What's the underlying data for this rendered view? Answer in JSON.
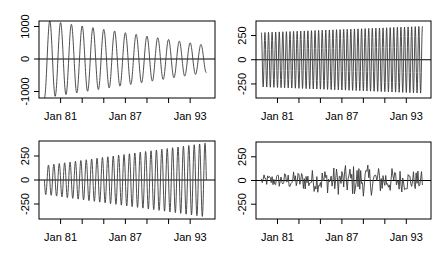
{
  "chart_data": [
    {
      "panel": "top-left",
      "type": "line",
      "title": "",
      "xlabel": "",
      "ylabel": "",
      "x_tick_labels": [
        "Jan 81",
        "Jan 87",
        "Jan 93"
      ],
      "y_tick_labels": [
        "-1000",
        "0",
        "1000"
      ],
      "y_ticks": [
        -1000,
        0,
        1000
      ],
      "ylim": [
        -1200,
        1170
      ],
      "xlim": [
        1979.0,
        1995.3
      ],
      "horizontal_reference_line": 0,
      "series": [
        {
          "name": "component",
          "start": 1979.5,
          "end": 1994.5,
          "cycles_per_year": 1.0,
          "amp_start": 1200,
          "amp_end": 420,
          "phase": 3.14159,
          "noise": 0
        }
      ],
      "box": {
        "left": 39,
        "top": 21,
        "right": 215,
        "bottom": 98
      }
    },
    {
      "panel": "top-right",
      "type": "line",
      "title": "",
      "xlabel": "",
      "ylabel": "",
      "x_tick_labels": [
        "Jan 81",
        "Jan 87",
        "Jan 93"
      ],
      "y_tick_labels": [
        "-250",
        "0",
        "250"
      ],
      "y_ticks": [
        -250,
        0,
        250
      ],
      "ylim": [
        -395,
        400
      ],
      "xlim": [
        1979.0,
        1995.3
      ],
      "horizontal_reference_line": 0,
      "series": [
        {
          "name": "component",
          "start": 1979.5,
          "end": 1994.5,
          "cycles_per_year": 3.0,
          "amp_start": 280,
          "amp_end": 345,
          "phase": 0,
          "noise": 0
        }
      ],
      "box": {
        "left": 256,
        "top": 21,
        "right": 431,
        "bottom": 98
      }
    },
    {
      "panel": "bottom-left",
      "type": "line",
      "title": "",
      "xlabel": "",
      "ylabel": "",
      "x_tick_labels": [
        "Jan 81",
        "Jan 87",
        "Jan 93"
      ],
      "y_tick_labels": [
        "-250",
        "0",
        "250"
      ],
      "y_ticks": [
        -250,
        0,
        250
      ],
      "ylim": [
        -406,
        406
      ],
      "xlim": [
        1979.0,
        1995.3
      ],
      "horizontal_reference_line": 0,
      "series": [
        {
          "name": "component",
          "start": 1979.5,
          "end": 1994.5,
          "cycles_per_year": 2.0,
          "amp_start": 150,
          "amp_end": 385,
          "phase": 1.57,
          "noise": 0
        }
      ],
      "box": {
        "left": 39,
        "top": 141,
        "right": 215,
        "bottom": 219
      }
    },
    {
      "panel": "bottom-right",
      "type": "line",
      "title": "",
      "xlabel": "",
      "ylabel": "",
      "x_tick_labels": [
        "Jan 81",
        "Jan 87",
        "Jan 93"
      ],
      "y_tick_labels": [
        "-250",
        "0",
        "250"
      ],
      "y_ticks": [
        -250,
        0,
        250
      ],
      "ylim": [
        -406,
        406
      ],
      "xlim": [
        1979.0,
        1995.3
      ],
      "horizontal_reference_line": 0,
      "series": [
        {
          "name": "residual",
          "start": 1979.5,
          "end": 1994.5,
          "cycles_per_year": 6.0,
          "amp_start": 80,
          "amp_mid": 250,
          "amp_end": 140,
          "phase": 0,
          "noise": 1
        }
      ],
      "box": {
        "left": 256,
        "top": 142,
        "right": 431,
        "bottom": 219
      }
    }
  ],
  "x_axis": {
    "major_ticks": [
      1981,
      1987,
      1993
    ],
    "minor_ticks": [
      1983,
      1985,
      1989,
      1991
    ]
  }
}
